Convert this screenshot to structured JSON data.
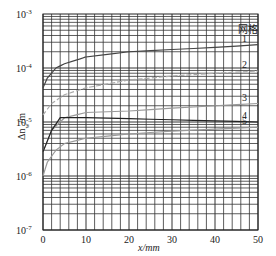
{
  "chart_data": {
    "type": "line",
    "title": "",
    "xlabel": "x/mm",
    "ylabel": "Δn_w/m",
    "xscale": "linear",
    "yscale": "log",
    "xlim": [
      0,
      50
    ],
    "ylim": [
      1e-07,
      0.001
    ],
    "x_ticks": [
      "0",
      "10",
      "20",
      "30",
      "40",
      "50"
    ],
    "y_ticks": [
      "10^-3",
      "10^-4",
      "10^-5",
      "10^-6",
      "10^-7"
    ],
    "grid": true,
    "legend_title": "网格",
    "legend_position": "right, inline labels",
    "series": [
      {
        "name": "1",
        "color": "#444444",
        "dash": "solid",
        "x": [
          0,
          1,
          3,
          5,
          10,
          20,
          30,
          40,
          50
        ],
        "values": [
          4.3e-05,
          6.5e-05,
          0.0001,
          0.00012,
          0.00016,
          0.0002,
          0.00022,
          0.00024,
          0.00027
        ]
      },
      {
        "name": "2",
        "color": "#aaaaaa",
        "dash": "dashed",
        "x": [
          0,
          2,
          5,
          10,
          20,
          30,
          40,
          50
        ],
        "values": [
          1.35e-05,
          2.2e-05,
          3.2e-05,
          4.3e-05,
          6e-05,
          7.1e-05,
          8e-05,
          8.8e-05
        ]
      },
      {
        "name": "3",
        "color": "#999999",
        "dash": "solid",
        "x": [
          0,
          2,
          5,
          10,
          20,
          30,
          40,
          50
        ],
        "values": [
          2.8e-06,
          7e-06,
          1.2e-05,
          1.5e-05,
          1.6e-05,
          1.8e-05,
          2e-05,
          2.2e-05
        ]
      },
      {
        "name": "4",
        "color": "#222222",
        "dash": "solid",
        "x": [
          0,
          2,
          4,
          10,
          20,
          30,
          40,
          50
        ],
        "values": [
          2.8e-06,
          7e-06,
          1.2e-05,
          1.2e-05,
          1.15e-05,
          1.1e-05,
          1.05e-05,
          1e-05
        ]
      },
      {
        "name": "5",
        "color": "#999999",
        "dash": "solid",
        "x": [
          0,
          1,
          3,
          5,
          10,
          20,
          30,
          40,
          50
        ],
        "values": [
          1e-06,
          1.8e-06,
          3e-06,
          4e-06,
          5e-06,
          6e-06,
          6.8e-06,
          7.4e-06,
          8e-06
        ]
      }
    ]
  },
  "axis": {
    "x_label": "x/mm",
    "y_label_main": "Δn",
    "y_label_sub": "w",
    "y_label_unit": "/m",
    "legend_title": "网格"
  }
}
